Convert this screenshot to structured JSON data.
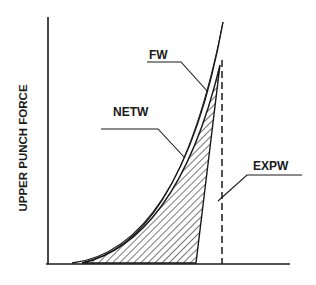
{
  "diagram": {
    "y_axis_label": "UPPER PUNCH FORCE",
    "x_axis_label": "",
    "labels": {
      "fw": "FW",
      "netw": "NETW",
      "expw": "EXPW"
    },
    "colors": {
      "line": "#1a1a1a",
      "background": "#ffffff"
    },
    "regions": [
      {
        "name": "FW",
        "description": "total work under outer loading curve"
      },
      {
        "name": "NETW",
        "description": "net work, hatched region between loading and unloading curves"
      },
      {
        "name": "EXPW",
        "description": "expansion work, marked by dashed vertical line at max displacement"
      }
    ]
  }
}
